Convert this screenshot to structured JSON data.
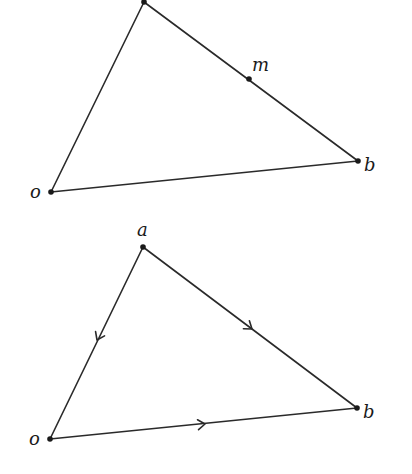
{
  "diagrams": [
    {
      "name": "triangle-with-midpoint",
      "points": {
        "a": {
          "x": 144,
          "y": 2,
          "label": "",
          "lx": 0,
          "ly": 0
        },
        "m": {
          "x": 249,
          "y": 79,
          "label": "m",
          "lx": 252,
          "ly": 71
        },
        "b": {
          "x": 358,
          "y": 161,
          "label": "b",
          "lx": 364,
          "ly": 171
        },
        "o": {
          "x": 51,
          "y": 192,
          "label": "o",
          "lx": 30,
          "ly": 198
        }
      },
      "edges": [
        [
          "o",
          "a"
        ],
        [
          "a",
          "b"
        ],
        [
          "o",
          "b"
        ]
      ]
    },
    {
      "name": "triangle-with-directed-edges",
      "points": {
        "a": {
          "x": 143,
          "y": 247,
          "label": "a",
          "lx": 137,
          "ly": 236
        },
        "b": {
          "x": 357,
          "y": 408,
          "label": "b",
          "lx": 363,
          "ly": 418
        },
        "o": {
          "x": 50,
          "y": 439,
          "label": "o",
          "lx": 29,
          "ly": 445
        }
      },
      "edges": [
        [
          "a",
          "o"
        ],
        [
          "a",
          "b"
        ],
        [
          "o",
          "b"
        ]
      ],
      "arrows": [
        {
          "edge": "a-o",
          "at": 0.5,
          "direction": "toward-o"
        },
        {
          "edge": "a-b",
          "at": 0.5,
          "direction": "toward-b"
        },
        {
          "edge": "o-b",
          "at": 0.5,
          "direction": "toward-b"
        }
      ]
    }
  ],
  "labels": {
    "top": {
      "m": "m",
      "b": "b",
      "o": "o"
    },
    "bottom": {
      "a": "a",
      "b": "b",
      "o": "o"
    }
  }
}
